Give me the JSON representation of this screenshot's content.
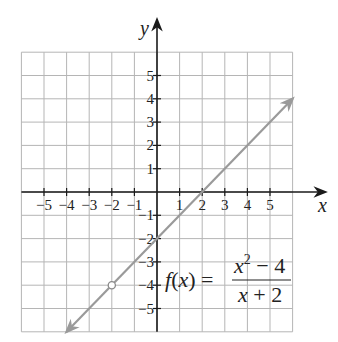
{
  "chart_data": {
    "type": "line",
    "title": "",
    "xlabel": "x",
    "ylabel": "y",
    "xlim": [
      -6,
      6
    ],
    "ylim": [
      -6,
      6
    ],
    "grid": true,
    "x_ticks": [
      -5,
      -4,
      -3,
      -2,
      -1,
      1,
      2,
      3,
      4,
      5
    ],
    "y_ticks": [
      5,
      4,
      3,
      2,
      1,
      -1,
      -2,
      -3,
      -4,
      -5
    ],
    "x_tick_labels": [
      "−5",
      "−4",
      "−3",
      "−2",
      "−1",
      "1",
      "2",
      "3",
      "4",
      "5"
    ],
    "y_tick_labels": [
      "5",
      "4",
      "3",
      "2",
      "1",
      "−1",
      "−2",
      "−3",
      "−4",
      "−5"
    ],
    "series": [
      {
        "name": "f(x) = (x^2 - 4)/(x + 2)",
        "x": [
          -4,
          6
        ],
        "y": [
          -6,
          4
        ],
        "equivalent": "y = x - 2",
        "arrows_both_ends": true,
        "color": "#9a9a9a"
      }
    ],
    "annotations": [
      {
        "type": "open_circle",
        "x": -2,
        "y": -4,
        "note": "hole (undefined at x = -2)"
      },
      {
        "type": "formula",
        "text": "f(x) = (x^2 - 4)/(x + 2)",
        "position": [
          2,
          -4
        ]
      }
    ]
  },
  "labels": {
    "x_axis": "x",
    "y_axis": "y",
    "formula_lhs": "f(x) =",
    "formula_num_base": "x",
    "formula_num_exp": "2",
    "formula_num_rest": " − 4",
    "formula_den": "x + 2"
  },
  "colors": {
    "grid": "#b5b5b5",
    "axis": "#1a1a1a",
    "line": "#9a9a9a"
  }
}
